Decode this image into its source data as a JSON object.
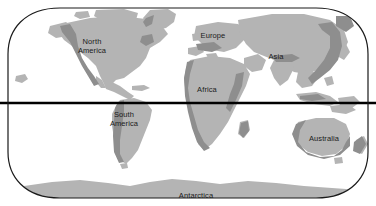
{
  "figure": {
    "kind": "world-map",
    "projection_name": "oval world projection",
    "width": 376,
    "height": 206,
    "background_color": "#ffffff"
  },
  "colors": {
    "ocean": "#ffffff",
    "land_light": "#b4b4b4",
    "land_dark": "#8e8e8e",
    "border": "#1a1a1a",
    "equator": "#000000",
    "label_text": "#1b1b1b"
  },
  "frame": {
    "border_width": 1.2,
    "equator_line_width": 2.6,
    "equator_y": 103
  },
  "labels": [
    {
      "name": "north-america",
      "text": "North\nAmerica",
      "x": 92,
      "y": 46
    },
    {
      "name": "south-america",
      "text": "South\nAmerica",
      "x": 124,
      "y": 119
    },
    {
      "name": "europe",
      "text": "Europe",
      "x": 213,
      "y": 36
    },
    {
      "name": "africa",
      "text": "Africa",
      "x": 207,
      "y": 90
    },
    {
      "name": "asia",
      "text": "Asia",
      "x": 276,
      "y": 57
    },
    {
      "name": "australia",
      "text": "Australia",
      "x": 324,
      "y": 139
    },
    {
      "name": "antarctica",
      "text": "Antarctica",
      "x": 196,
      "y": 196
    }
  ]
}
